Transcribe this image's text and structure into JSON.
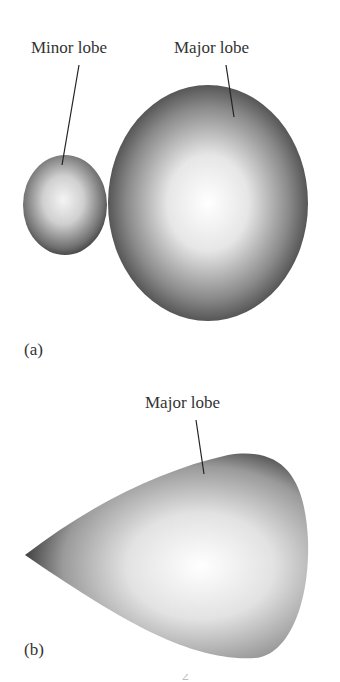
{
  "figure": {
    "panel_a": {
      "tag": "(a)",
      "labels": {
        "minor": "Minor lobe",
        "major": "Major lobe"
      }
    },
    "panel_b": {
      "tag": "(b)",
      "labels": {
        "major": "Major lobe"
      }
    },
    "footer_fragment": "2"
  }
}
